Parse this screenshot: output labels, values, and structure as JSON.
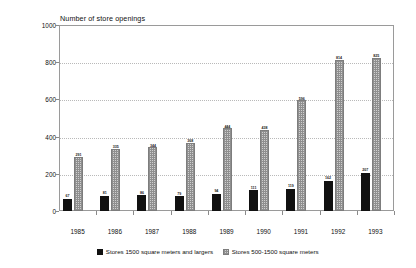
{
  "chart_data": {
    "type": "bar",
    "title": "Number of store openings",
    "xlabel": "",
    "ylabel": "",
    "ylim": [
      0,
      1000
    ],
    "yticks": [
      0,
      200,
      400,
      600,
      800,
      1000
    ],
    "grid": true,
    "legend_position": "bottom",
    "categories": [
      "1985",
      "1986",
      "1987",
      "1988",
      "1989",
      "1990",
      "1991",
      "1992",
      "1993"
    ],
    "series": [
      {
        "name": "Stores 1500 square meters and largers",
        "color": "#111111",
        "values": [
          67,
          81,
          86,
          79,
          94,
          111,
          119,
          162,
          207
        ]
      },
      {
        "name": "Stores 500-1500 square meters",
        "color": "#cfcfcf",
        "values": [
          291,
          335,
          344,
          368,
          444,
          438,
          596,
          814,
          825
        ]
      }
    ]
  }
}
